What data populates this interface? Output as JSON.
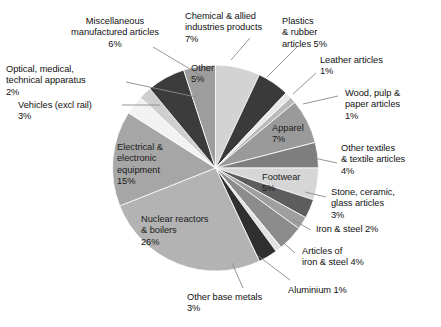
{
  "chart_data": {
    "type": "pie",
    "title": "",
    "subtitle": "",
    "xlabel": "",
    "ylabel": "",
    "legend_position": "callout-labels",
    "grid": false,
    "units": "percent",
    "total": 100,
    "start_angle_deg": 0,
    "direction": "clockwise",
    "categories": [
      "Chemical & allied industries products",
      "Plastics & rubber articles",
      "Leather articles",
      "Wood, pulp & paper articles",
      "Apparel",
      "Other textiles & textile articles",
      "Footwear",
      "Stone, ceramic, glass articles",
      "Iron & steel",
      "Articles of iron & steel",
      "Aluminium",
      "Other base metals",
      "Nuclear reactors & boilers",
      "Electrical & electronic equipment",
      "Vehicles (excl rail)",
      "Optical, medical, technical apparatus",
      "Miscellaneous manufactured articles",
      "Other"
    ],
    "values": [
      7,
      5,
      1,
      1,
      7,
      4,
      5,
      3,
      2,
      4,
      1,
      3,
      26,
      15,
      3,
      2,
      6,
      5
    ],
    "colors": [
      "#d3d3d3",
      "#3a3a3a",
      "#e8e8e8",
      "#b9b9b9",
      "#9a9a9a",
      "#7e7e7e",
      "#d6d6d6",
      "#5d5d5d",
      "#9f9f9f",
      "#8c8c8c",
      "#e3e3e3",
      "#2f2f2f",
      "#b3b3b3",
      "#a6a6a6",
      "#f2f2f2",
      "#cfcfcf",
      "#3c3c3c",
      "#9d9d9d"
    ],
    "slices": [
      {
        "label": "Chemical & allied industries products",
        "value": 7,
        "display": "7%",
        "color": "#d3d3d3",
        "label_placement": "outside"
      },
      {
        "label": "Plastics & rubber articles",
        "value": 5,
        "display": "5%",
        "color": "#3a3a3a",
        "label_placement": "outside"
      },
      {
        "label": "Leather articles",
        "value": 1,
        "display": "1%",
        "color": "#e8e8e8",
        "label_placement": "outside"
      },
      {
        "label": "Wood, pulp & paper articles",
        "value": 1,
        "display": "1%",
        "color": "#b9b9b9",
        "label_placement": "outside"
      },
      {
        "label": "Apparel",
        "value": 7,
        "display": "7%",
        "color": "#9a9a9a",
        "label_placement": "inside"
      },
      {
        "label": "Other textiles & textile articles",
        "value": 4,
        "display": "4%",
        "color": "#7e7e7e",
        "label_placement": "outside"
      },
      {
        "label": "Footwear",
        "value": 5,
        "display": "5%",
        "color": "#d6d6d6",
        "label_placement": "inside"
      },
      {
        "label": "Stone, ceramic, glass articles",
        "value": 3,
        "display": "3%",
        "color": "#5d5d5d",
        "label_placement": "outside"
      },
      {
        "label": "Iron & steel",
        "value": 2,
        "display": "2%",
        "color": "#9f9f9f",
        "label_placement": "outside"
      },
      {
        "label": "Articles of iron & steel",
        "value": 4,
        "display": "4%",
        "color": "#8c8c8c",
        "label_placement": "outside"
      },
      {
        "label": "Aluminium",
        "value": 1,
        "display": "1%",
        "color": "#e3e3e3",
        "label_placement": "outside"
      },
      {
        "label": "Other base metals",
        "value": 3,
        "display": "3%",
        "color": "#2f2f2f",
        "label_placement": "outside"
      },
      {
        "label": "Nuclear reactors & boilers",
        "value": 26,
        "display": "26%",
        "color": "#b3b3b3",
        "label_placement": "inside"
      },
      {
        "label": "Electrical & electronic equipment",
        "value": 15,
        "display": "15%",
        "color": "#a6a6a6",
        "label_placement": "inside"
      },
      {
        "label": "Vehicles (excl rail)",
        "value": 3,
        "display": "3%",
        "color": "#f2f2f2",
        "label_placement": "outside"
      },
      {
        "label": "Optical, medical, technical apparatus",
        "value": 2,
        "display": "2%",
        "color": "#cfcfcf",
        "label_placement": "outside"
      },
      {
        "label": "Miscellaneous manufactured articles",
        "value": 6,
        "display": "6%",
        "color": "#3c3c3c",
        "label_placement": "outside"
      },
      {
        "label": "Other",
        "value": 5,
        "display": "5%",
        "color": "#9d9d9d",
        "label_placement": "inside"
      }
    ]
  },
  "labels": {
    "miscellaneous": "Miscellaneous\nmanufactured articles\n6%",
    "optical": "Optical, medical,\ntechnical apparatus\n2%",
    "vehicles": "Vehicles (excl rail)\n3%",
    "chemical": "Chemical & allied\nindustries products\n7%",
    "plastics": "Plastics\n& rubber\narticles 5%",
    "leather": "Leather articles\n1%",
    "wood": "Wood, pulp &\npaper articles\n1%",
    "other_textiles": "Other textiles\n& textile articles\n4%",
    "stone": "Stone, ceramic,\nglass articles\n3%",
    "iron_steel": "Iron & steel 2%",
    "articles_iron_steel": "Articles of\niron & steel 4%",
    "aluminium": "Aluminium 1%",
    "other_base_metals": "Other base metals\n3%",
    "nuclear": "Nuclear reactors\n& boilers\n26%",
    "electrical": "Electrical &\nelectronic\nequipment\n15%",
    "apparel": "Apparel\n7%",
    "footwear": "Footwear\n5%",
    "other": "Other\n5%"
  }
}
